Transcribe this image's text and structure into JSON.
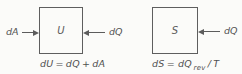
{
  "figure": {
    "ink_color": "#5c5c5c",
    "background_color": "#fbfbf9",
    "left_diagram": {
      "box_symbol": "U",
      "work_label": "dA",
      "heat_label": "dQ",
      "equation": {
        "t1": "dU",
        "t2": "=",
        "t3": "dQ",
        "t4": "+",
        "t5": "dA"
      }
    },
    "right_diagram": {
      "box_symbol": "S",
      "heat_label": "dQ",
      "equation": {
        "t1": "dS",
        "t2": "=",
        "t3": "dQ",
        "sub": "rev",
        "t4": "/",
        "t5": "T"
      }
    }
  }
}
